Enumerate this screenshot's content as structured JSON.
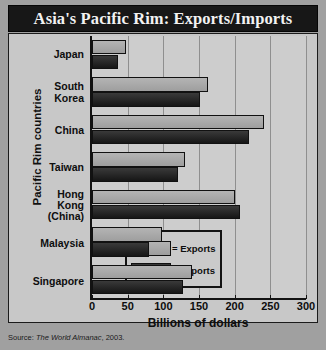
{
  "title": "Asia's Pacific Rim: Exports/Imports",
  "source": {
    "prefix": "Source: ",
    "italic": "The World Almanac",
    "suffix": ", 2003."
  },
  "legend": {
    "exports_label": "= Exports",
    "imports_label": "= Imports"
  },
  "colors": {
    "exports": "#a8a8a8",
    "imports": "#222222",
    "title_bg": "#171717",
    "title_fg": "#f2f2f2",
    "plot_bg": "#cdcdcd",
    "frame_bg": "#c8c8c8",
    "page_bg": "#a0a0a0",
    "axis": "#121212",
    "grid": "#8f8f8f"
  },
  "chart_data": {
    "type": "bar",
    "orientation": "horizontal",
    "title": "Asia's Pacific Rim: Exports/Imports",
    "xlabel": "Billions of dollars",
    "ylabel": "Pacific Rim countries",
    "xlim": [
      0,
      300
    ],
    "xticks": [
      0,
      50,
      100,
      150,
      200,
      250,
      300
    ],
    "xtick_labels": [
      "0",
      "50",
      "100",
      "150",
      "200",
      "250",
      "300"
    ],
    "grid": true,
    "legend_position": "inside-lower-right",
    "categories": [
      "Japan",
      "South\nKorea",
      "China",
      "Taiwan",
      "Hong Kong\n(China)",
      "Malaysia",
      "Singapore"
    ],
    "series": [
      {
        "name": "Exports",
        "values": [
          47,
          162,
          241,
          130,
          200,
          98,
          140
        ]
      },
      {
        "name": "Imports",
        "values": [
          37,
          152,
          220,
          120,
          208,
          80,
          128
        ]
      }
    ]
  }
}
